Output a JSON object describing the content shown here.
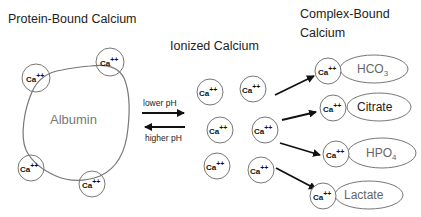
{
  "titles": {
    "protein_bound": "Protein-Bound Calcium",
    "ionized": "Ionized Calcium",
    "complex_bound_line1": "Complex-Bound",
    "complex_bound_line2": "Calcium"
  },
  "protein": {
    "label": "Albumin",
    "ions": [
      {
        "text": "Ca",
        "charge": "++"
      },
      {
        "text": "Ca",
        "charge": "++"
      },
      {
        "text": "Ca",
        "charge": "++"
      },
      {
        "text": "Ca",
        "charge": "++"
      }
    ]
  },
  "equilibrium": {
    "forward_label": "lower pH",
    "reverse_label": "higher pH"
  },
  "ionized": {
    "ions": [
      {
        "text": "Ca",
        "charge": "++"
      },
      {
        "text": "Ca",
        "charge": "++"
      },
      {
        "text": "Ca",
        "charge": "++"
      },
      {
        "text": "Ca",
        "charge": "++"
      },
      {
        "text": "Ca",
        "charge": "++"
      },
      {
        "text": "Ca",
        "charge": "++"
      }
    ]
  },
  "complexes": [
    {
      "ion": "Ca",
      "charge": "++",
      "ligand": "HCO",
      "subscript": "3"
    },
    {
      "ion": "Ca",
      "charge": "++",
      "ligand": "Citrate",
      "subscript": ""
    },
    {
      "ion": "Ca",
      "charge": "++",
      "ligand": "HPO",
      "subscript": "4"
    },
    {
      "ion": "Ca",
      "charge": "++",
      "ligand": "Lactate",
      "subscript": ""
    }
  ],
  "colors": {
    "stroke": "#777777",
    "arrow": "#111111",
    "text": "#222222"
  }
}
